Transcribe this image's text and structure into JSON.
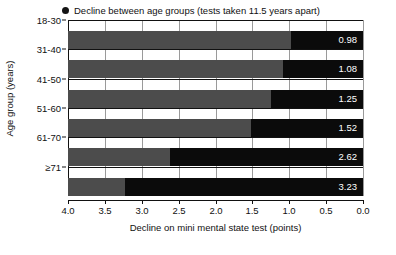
{
  "chart_data": {
    "type": "bar",
    "title": "",
    "orientation": "horizontal",
    "legend": {
      "marker": "filled-circle",
      "label": "Decline between age groups (tests taken 11.5 years apart)",
      "position": "top-left"
    },
    "xlabel": "Decline on mini mental state test (points)",
    "ylabel": "Age group (years)",
    "xlim": [
      4.0,
      0.0
    ],
    "x_reversed": true,
    "xticks": [
      "4.0",
      "3.5",
      "3.0",
      "2.5",
      "2.0",
      "1.5",
      "1.0",
      "0.5",
      "0.0"
    ],
    "xtick_values": [
      4.0,
      3.5,
      3.0,
      2.5,
      2.0,
      1.5,
      1.0,
      0.5,
      0.0
    ],
    "grid": "vertical",
    "categories": [
      "18-30",
      "31-40",
      "41-50",
      "51-60",
      "61-70",
      "≥71"
    ],
    "values": [
      0.98,
      1.08,
      1.25,
      1.52,
      2.62,
      3.23
    ],
    "value_labels": [
      "0.98",
      "1.08",
      "1.25",
      "1.52",
      "2.62",
      "3.23"
    ],
    "series": [
      {
        "name": "Decline between age groups",
        "values": [
          0.98,
          1.08,
          1.25,
          1.52,
          2.62,
          3.23
        ]
      }
    ],
    "colors": {
      "bar_base": "#4c4c4c",
      "bar_decline": "#0b0b0b",
      "value_text": "#ffffff",
      "axis": "#111111",
      "gridline": "#9a9a9a",
      "background": "#ffffff"
    }
  }
}
